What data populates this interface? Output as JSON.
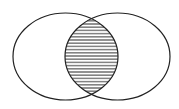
{
  "diagram": {
    "type": "venn",
    "sets": 2,
    "highlighted_region": "intersection",
    "fill_pattern": "horizontal-lines",
    "colors": {
      "stroke": "#222222",
      "background": "#ffffff"
    }
  }
}
